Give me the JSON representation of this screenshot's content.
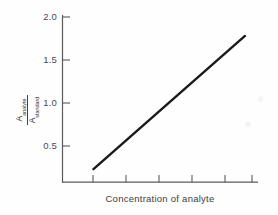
{
  "chart_data": {
    "type": "line",
    "title": "",
    "subtitle": "",
    "xlabel": "Concentration of analyte",
    "ylabel": "A_analyte / A_standard",
    "ylabel_numerator": "A",
    "ylabel_numerator_sub": "analyte",
    "ylabel_denominator": "A",
    "ylabel_denominator_sub": "standard",
    "ytick_labels": [
      "0.5",
      "1.0",
      "1.5",
      "2.0"
    ],
    "ytick_values": [
      0.5,
      1.0,
      1.5,
      2.0
    ],
    "xtick_labels": [
      "",
      "",
      "",
      "",
      "",
      ""
    ],
    "xtick_count": 6,
    "ylim": [
      0,
      2.2
    ],
    "xlim": [
      0,
      6
    ],
    "grid": false,
    "legend": false,
    "legend_position": "none",
    "series": [
      {
        "name": "calibration-line",
        "x": [
          0.95,
          5.6
        ],
        "y": [
          0.23,
          1.78
        ],
        "color": "#1a1a1a",
        "style": "solid",
        "width": 2.4
      }
    ],
    "annotations": []
  },
  "figure": {
    "background": "#ffffff",
    "axis_color": "#555555",
    "line_color": "#1a1a1a",
    "text_color": "#3d3d3d"
  }
}
